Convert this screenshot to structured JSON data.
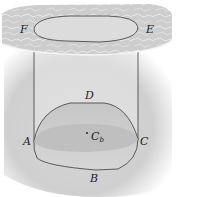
{
  "figure": {
    "labels": {
      "F": "F",
      "E": "E",
      "D": "D",
      "A": "A",
      "C": "C",
      "B": "B",
      "Cb_main": "C",
      "Cb_sub": "b"
    },
    "colors": {
      "background": "#ffffff",
      "liquid": "#d4d4d4",
      "surface_texture": "#c8c8c8",
      "surface_highlight": "#eeeeee",
      "waterline_section": "#bdbdbd",
      "outline": "#3a3a3a"
    }
  }
}
